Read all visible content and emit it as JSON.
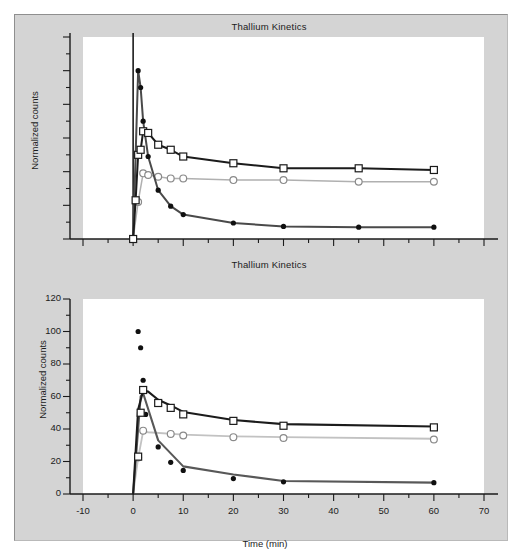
{
  "figure": {
    "background": "#ffffff",
    "panel_background": "#d4d4d4",
    "plot_background": "#ffffff"
  },
  "charts": [
    {
      "id": "top",
      "title": "Thallium Kinetics",
      "ylabel": "Normalized counts",
      "xlabel": "",
      "x_tick_labels": [],
      "y_tick_labels": []
    },
    {
      "id": "bottom",
      "title": "Thallium Kinetics",
      "ylabel": "Normalized counts",
      "xlabel": "Time (min)",
      "x_tick_labels": [
        "-10",
        "0",
        "10",
        "20",
        "30",
        "40",
        "50",
        "60",
        "70"
      ],
      "y_tick_labels": [
        "0",
        "20",
        "40",
        "60",
        "80",
        "100",
        "120"
      ]
    }
  ],
  "chart_data": [
    {
      "type": "line",
      "id": "top-panel",
      "title": "Thallium Kinetics",
      "xlabel": "",
      "ylabel": "Normalized counts",
      "xlim": [
        -10,
        70
      ],
      "ylim": [
        0,
        120
      ],
      "grid": false,
      "legend": "none",
      "axis_ticks_labeled": false,
      "x_major_ticks": [
        -10,
        0,
        10,
        20,
        30,
        40,
        50,
        60,
        70
      ],
      "y_major_ticks": [
        0,
        20,
        40,
        60,
        80,
        100,
        120
      ],
      "note": "Same data as bottom panel shown without tick labels; vertical spike at t=0",
      "series": [
        {
          "name": "open-square-series",
          "marker": "open-square",
          "line_color": "#1b1b1b",
          "marker_edge": "#1b1b1b",
          "marker_face": "#ffffff",
          "x": [
            0,
            0.5,
            1,
            1.5,
            2,
            3,
            5,
            7.5,
            10,
            20,
            30,
            45,
            60
          ],
          "y": [
            0,
            23,
            50,
            53,
            64,
            63,
            56,
            53,
            49,
            45,
            42,
            42,
            41
          ]
        },
        {
          "name": "open-circle-series",
          "marker": "open-circle",
          "line_color": "#b0b0b0",
          "marker_edge": "#8a8a8a",
          "marker_face": "#ffffff",
          "x": [
            0,
            1,
            2,
            3,
            5,
            7.5,
            10,
            20,
            30,
            45,
            60
          ],
          "y": [
            0,
            22,
            39,
            38,
            37,
            36,
            36,
            35,
            35,
            34,
            34
          ]
        },
        {
          "name": "filled-dot-series",
          "marker": "filled-dot",
          "line_color": "#4a4a4a",
          "marker_edge": "#101010",
          "marker_face": "#101010",
          "x": [
            0,
            1,
            1.5,
            2,
            3,
            5,
            7.5,
            10,
            20,
            30,
            45,
            60
          ],
          "y": [
            0,
            100,
            90,
            70,
            49,
            29,
            19.5,
            14.5,
            9.5,
            7.5,
            7,
            7
          ]
        }
      ]
    },
    {
      "type": "line",
      "id": "bottom-panel",
      "title": "Thallium Kinetics",
      "xlabel": "Time (min)",
      "ylabel": "Normalized counts",
      "xlim": [
        -10,
        70
      ],
      "ylim": [
        0,
        120
      ],
      "grid": false,
      "legend": "none",
      "x_major_ticks": [
        -10,
        0,
        10,
        20,
        30,
        40,
        50,
        60,
        70
      ],
      "x_minor_tick_step": 5,
      "y_major_ticks": [
        0,
        20,
        40,
        60,
        80,
        100,
        120
      ],
      "y_minor_tick_step": 10,
      "series": [
        {
          "name": "open-square-series",
          "marker": "open-square",
          "line_color": "#1b1b1b",
          "marker_edge": "#1b1b1b",
          "marker_face": "#ffffff",
          "fit_x": [
            0,
            1,
            2,
            3,
            5,
            7.5,
            10,
            20,
            30,
            60
          ],
          "fit_y": [
            0,
            52,
            63.5,
            63,
            58,
            54.5,
            50.5,
            45.5,
            43,
            41.5
          ],
          "x": [
            1,
            1.5,
            2,
            5,
            7.5,
            10,
            20,
            30,
            60
          ],
          "y": [
            23,
            50,
            64,
            56,
            53,
            49,
            45,
            42,
            41
          ]
        },
        {
          "name": "open-circle-series",
          "marker": "open-circle",
          "line_color": "#c2c2c2",
          "marker_edge": "#8a8a8a",
          "marker_face": "#ffffff",
          "fit_x": [
            0,
            1,
            2,
            3,
            10,
            20,
            30,
            60
          ],
          "fit_y": [
            0,
            22,
            38.5,
            38,
            36.5,
            35.5,
            35,
            34
          ],
          "x": [
            1,
            2,
            7.5,
            10,
            20,
            30,
            60
          ],
          "y": [
            22.5,
            39,
            37,
            36,
            35,
            34.5,
            33.5
          ]
        },
        {
          "name": "filled-dot-series",
          "marker": "filled-dot",
          "line_color": "#585858",
          "marker_edge": "#101010",
          "marker_face": "#101010",
          "fit_x": [
            0,
            1.5,
            2,
            5,
            10,
            20,
            30,
            60
          ],
          "fit_y": [
            0,
            60,
            62,
            33,
            17,
            12,
            8,
            7
          ],
          "x": [
            1,
            1.5,
            2,
            2.5,
            5,
            7.5,
            10,
            20,
            30,
            60
          ],
          "y": [
            100,
            90,
            70,
            49,
            29,
            19.5,
            14.5,
            9.5,
            7.5,
            7
          ]
        }
      ]
    }
  ]
}
